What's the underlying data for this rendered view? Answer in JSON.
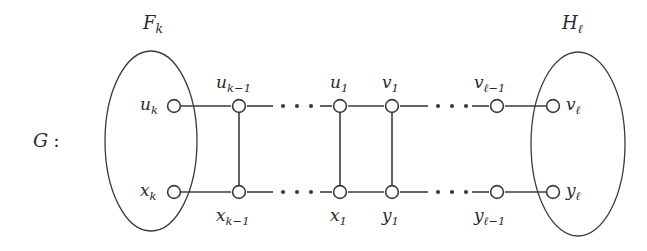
{
  "figure": {
    "graph_name": "G",
    "graph_name_separator": ":",
    "groups": [
      {
        "id": "F_k",
        "base": "F",
        "sub": "k",
        "side": "left"
      },
      {
        "id": "H_l",
        "base": "H",
        "sub": "ℓ",
        "side": "right"
      }
    ],
    "top_row": [
      {
        "id": "u_k",
        "base": "u",
        "sub": "k",
        "label_side": "left"
      },
      {
        "id": "u_k-1",
        "base": "u",
        "sub": "k−1",
        "label_side": "above"
      },
      {
        "id": "u_1",
        "base": "u",
        "sub": "1",
        "label_side": "above"
      },
      {
        "id": "v_1",
        "base": "v",
        "sub": "1",
        "label_side": "above"
      },
      {
        "id": "v_l-1",
        "base": "v",
        "sub": "ℓ−1",
        "label_side": "above"
      },
      {
        "id": "v_l",
        "base": "v",
        "sub": "ℓ",
        "label_side": "right"
      }
    ],
    "bottom_row": [
      {
        "id": "x_k",
        "base": "x",
        "sub": "k",
        "label_side": "left"
      },
      {
        "id": "x_k-1",
        "base": "x",
        "sub": "k−1",
        "label_side": "below"
      },
      {
        "id": "x_1",
        "base": "x",
        "sub": "1",
        "label_side": "below"
      },
      {
        "id": "y_1",
        "base": "y",
        "sub": "1",
        "label_side": "below"
      },
      {
        "id": "y_l-1",
        "base": "y",
        "sub": "ℓ−1",
        "label_side": "below"
      },
      {
        "id": "y_l",
        "base": "y",
        "sub": "ℓ",
        "label_side": "right"
      }
    ],
    "ellipsis_groups": [
      {
        "id": "top-left-ellipsis",
        "dots": 3
      },
      {
        "id": "top-right-ellipsis",
        "dots": 3
      },
      {
        "id": "bottom-left-ellipsis",
        "dots": 3
      },
      {
        "id": "bottom-right-ellipsis",
        "dots": 3
      }
    ],
    "colors": {
      "stroke": "#3b3b3b",
      "node_fill": "#ffffff",
      "text": "#2b2b2b",
      "background": "#ffffff"
    }
  }
}
